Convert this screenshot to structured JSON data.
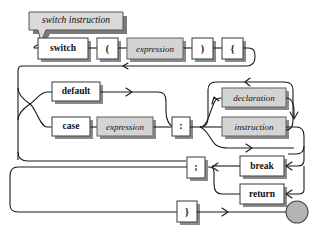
{
  "diagram": {
    "kind": "railroad-syntax-diagram",
    "title": "switch instruction",
    "colors": {
      "background": "#ffffff",
      "line": "#1a1a1a",
      "terminal_fill": "#ffffff",
      "nonterminal_fill": "#d4d4d4",
      "callout_fill": "#d9d9d9",
      "shadow": "#8a8a8a",
      "end_circle_fill": "#b3b3b3"
    },
    "callout": {
      "label": "switch instruction"
    },
    "nodes": [
      {
        "id": "switch",
        "label": "switch",
        "type": "terminal",
        "x": 38,
        "y": 38,
        "w": 50,
        "h": 21
      },
      {
        "id": "lparen",
        "label": "(",
        "type": "terminal",
        "x": 97,
        "y": 38,
        "w": 21,
        "h": 21
      },
      {
        "id": "expr1",
        "label": "expression",
        "type": "nonterminal",
        "x": 127,
        "y": 38,
        "w": 56,
        "h": 21
      },
      {
        "id": "rparen",
        "label": ")",
        "type": "terminal",
        "x": 192,
        "y": 38,
        "w": 21,
        "h": 21
      },
      {
        "id": "lbrace",
        "label": "{",
        "type": "terminal",
        "x": 222,
        "y": 38,
        "w": 21,
        "h": 21
      },
      {
        "id": "default",
        "label": "default",
        "type": "terminal",
        "x": 52,
        "y": 82,
        "w": 48,
        "h": 19
      },
      {
        "id": "case",
        "label": "case",
        "type": "terminal",
        "x": 52,
        "y": 117,
        "w": 38,
        "h": 19
      },
      {
        "id": "expr2",
        "label": "expression",
        "type": "nonterminal",
        "x": 97,
        "y": 117,
        "w": 56,
        "h": 19
      },
      {
        "id": "colon",
        "label": ":",
        "type": "terminal",
        "x": 172,
        "y": 117,
        "w": 18,
        "h": 19
      },
      {
        "id": "declaration",
        "label": "declaration",
        "type": "nonterminal",
        "x": 222,
        "y": 88,
        "w": 64,
        "h": 19
      },
      {
        "id": "instruction",
        "label": "instruction",
        "type": "nonterminal",
        "x": 222,
        "y": 117,
        "w": 64,
        "h": 19
      },
      {
        "id": "semicolon",
        "label": ";",
        "type": "terminal",
        "x": 187,
        "y": 157,
        "w": 18,
        "h": 21
      },
      {
        "id": "break",
        "label": "break",
        "type": "terminal",
        "x": 240,
        "y": 156,
        "w": 44,
        "h": 20
      },
      {
        "id": "return",
        "label": "return",
        "type": "terminal",
        "x": 240,
        "y": 184,
        "w": 44,
        "h": 20
      },
      {
        "id": "rbrace",
        "label": "}",
        "type": "terminal",
        "x": 177,
        "y": 201,
        "w": 20,
        "h": 21
      }
    ],
    "end_marker": {
      "cx": 297,
      "cy": 212,
      "r": 11
    }
  }
}
